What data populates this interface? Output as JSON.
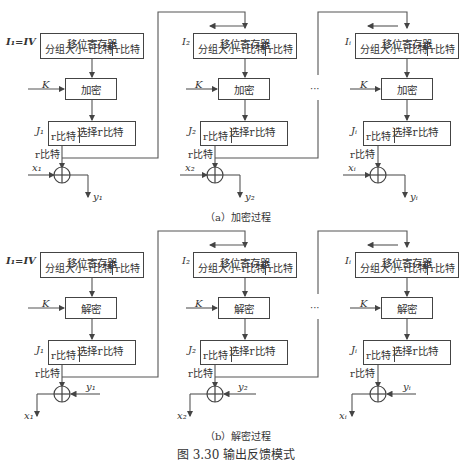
{
  "figure": {
    "number_caption": "图 3.30    输出反馈模式"
  },
  "encryption": {
    "caption": "（a）加密过程",
    "stages": [
      {
        "iv_label": "I₁=IV",
        "register_title": "移位寄存器",
        "register_left": "分组大小-r比特",
        "register_right": "r比特",
        "key": "K",
        "op": "加密",
        "select_label": "J₁",
        "select_title": "选择r比特",
        "select_sub": "r比特",
        "out_bits": "r比特",
        "input": "x₁",
        "output": "y₁"
      },
      {
        "iv_label": "I₂",
        "register_title": "移位寄存器",
        "register_left": "分组大小-r比特",
        "register_right": "r比特",
        "key": "K",
        "op": "加密",
        "select_label": "J₂",
        "select_title": "选择r比特",
        "select_sub": "r比特",
        "out_bits": "r比特",
        "input": "x₂",
        "output": "y₂"
      },
      {
        "iv_label": "Iᵢ",
        "register_title": "移位寄存器",
        "register_left": "分组大小-r比特",
        "register_right": "r比特",
        "key": "K",
        "op": "加密",
        "select_label": "Jᵢ",
        "select_title": "选择r比特",
        "select_sub": "r比特",
        "out_bits": "r比特",
        "input": "xᵢ",
        "output": "yᵢ"
      }
    ],
    "ellipsis": "···"
  },
  "decryption": {
    "caption": "（b）解密过程",
    "stages": [
      {
        "iv_label": "I₁=IV",
        "register_title": "移位寄存器",
        "register_left": "分组大小-r比特",
        "register_right": "r比特",
        "key": "K",
        "op": "解密",
        "select_label": "J₁",
        "select_title": "选择r比特",
        "select_sub": "r比特",
        "out_bits": "r比特",
        "input": "y₁",
        "output": "x₁"
      },
      {
        "iv_label": "I₂",
        "register_title": "移位寄存器",
        "register_left": "分组大小-r比特",
        "register_right": "r比特",
        "key": "K",
        "op": "解密",
        "select_label": "J₂",
        "select_title": "选择r比特",
        "select_sub": "r比特",
        "out_bits": "r比特",
        "input": "y₂",
        "output": "x₂"
      },
      {
        "iv_label": "Iᵢ",
        "register_title": "移位寄存器",
        "register_left": "分组大小-r比特",
        "register_right": "r比特",
        "key": "K",
        "op": "解密",
        "select_label": "Jᵢ",
        "select_title": "选择r比特",
        "select_sub": "r比特",
        "out_bits": "r比特",
        "input": "yᵢ",
        "output": "xᵢ"
      }
    ],
    "ellipsis": "···"
  }
}
